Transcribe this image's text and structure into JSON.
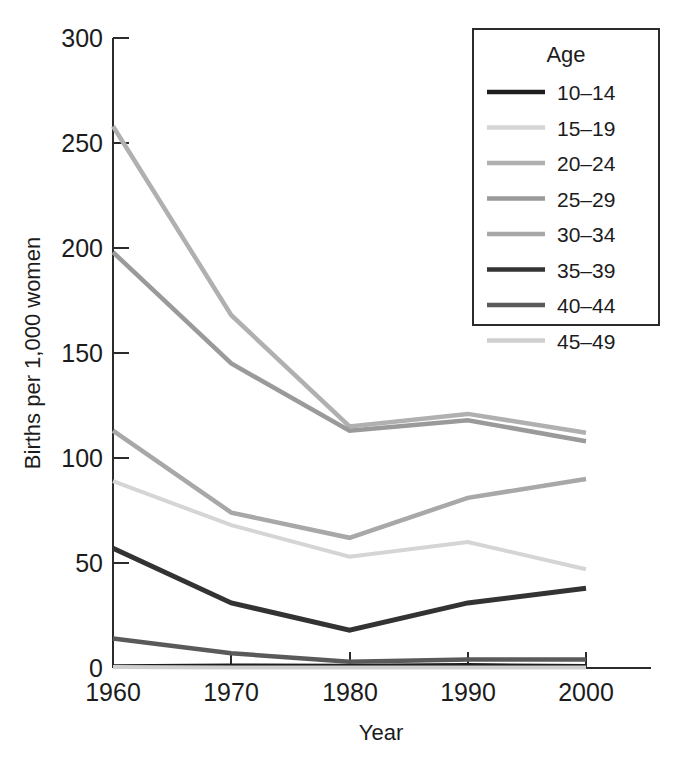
{
  "chart_data": {
    "type": "line",
    "title": "",
    "xlabel": "Year",
    "ylabel": "Births per 1,000 women",
    "x": [
      1960,
      1970,
      1980,
      1990,
      2000
    ],
    "xtick_labels": [
      "1960",
      "1970",
      "1980",
      "1990",
      "2000"
    ],
    "ytick_labels": [
      "0",
      "50",
      "100",
      "150",
      "200",
      "250",
      "300"
    ],
    "yticks": [
      0,
      50,
      100,
      150,
      200,
      250,
      300
    ],
    "xlim": [
      1960,
      2000
    ],
    "ylim": [
      0,
      300
    ],
    "grid": false,
    "legend_position": "top-right",
    "legend_title": "Age",
    "series": [
      {
        "name": "10–14",
        "color": "#1d1d1d",
        "width": 4.0,
        "values": [
          0.8,
          1.2,
          1.1,
          1.4,
          0.9
        ]
      },
      {
        "name": "15–19",
        "color": "#d5d5d5",
        "width": 4.0,
        "values": [
          89,
          68,
          53,
          60,
          47
        ]
      },
      {
        "name": "20–24",
        "color": "#b0b0b0",
        "width": 4.5,
        "values": [
          258,
          168,
          115,
          121,
          112
        ]
      },
      {
        "name": "25–29",
        "color": "#9a9a9a",
        "width": 4.5,
        "values": [
          198,
          145,
          113,
          118,
          108
        ]
      },
      {
        "name": "30–34",
        "color": "#a8a8a8",
        "width": 4.5,
        "values": [
          113,
          74,
          62,
          81,
          90
        ]
      },
      {
        "name": "35–39",
        "color": "#333333",
        "width": 5.0,
        "values": [
          57,
          31,
          18,
          31,
          38
        ]
      },
      {
        "name": "40–44",
        "color": "#5a5a5a",
        "width": 4.5,
        "values": [
          14,
          7,
          3,
          4,
          4
        ]
      },
      {
        "name": "45–49",
        "color": "#cfcfcf",
        "width": 4.0,
        "values": [
          0.5,
          0.3,
          0.2,
          0.2,
          0.2
        ]
      }
    ]
  },
  "legend": {
    "title": "Age",
    "items": [
      {
        "label": "10–14",
        "color": "#1d1d1d"
      },
      {
        "label": "15–19",
        "color": "#d5d5d5"
      },
      {
        "label": "20–24",
        "color": "#b0b0b0"
      },
      {
        "label": "25–29",
        "color": "#9a9a9a"
      },
      {
        "label": "30–34",
        "color": "#a8a8a8"
      },
      {
        "label": "35–39",
        "color": "#333333"
      },
      {
        "label": "40–44",
        "color": "#5a5a5a"
      },
      {
        "label": "45–49",
        "color": "#cfcfcf"
      }
    ]
  },
  "axes": {
    "x_title": "Year",
    "y_title": "Births per 1,000 women",
    "x_ticks": [
      "1960",
      "1970",
      "1980",
      "1990",
      "2000"
    ],
    "y_ticks": [
      "300",
      "250",
      "200",
      "150",
      "100",
      "50",
      "0"
    ]
  },
  "colors": {
    "axis": "#2b2b2b",
    "text": "#1c1c1c",
    "background": "#ffffff"
  }
}
